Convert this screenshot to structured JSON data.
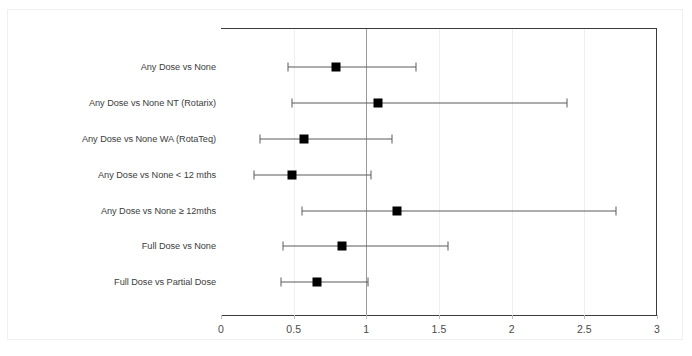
{
  "chart_data": {
    "type": "scatter",
    "subtype": "forest-plot",
    "title": "",
    "xlabel": "",
    "ylabel": "",
    "xlim": [
      0,
      3
    ],
    "xticks": [
      "0",
      "0.5",
      "1",
      "1.5",
      "2",
      "2.5",
      "3"
    ],
    "xtick_values": [
      0,
      0.5,
      1,
      1.5,
      2,
      2.5,
      3
    ],
    "grid": true,
    "legend": "none",
    "reference_line": 1,
    "categories": [
      "Any Dose vs None",
      "Any Dose vs None NT (Rotarix)",
      "Any Dose vs None WA (RotaTeq)",
      "Any Dose vs None < 12 mths",
      "Any Dose vs None ≥ 12mths",
      "Full Dose vs None",
      "Full Dose vs Partial Dose"
    ],
    "values": [
      0.79,
      1.08,
      0.57,
      0.49,
      1.21,
      0.83,
      0.66
    ],
    "ci_lower": [
      0.46,
      0.49,
      0.27,
      0.23,
      0.56,
      0.43,
      0.41
    ],
    "ci_upper": [
      1.34,
      2.38,
      1.18,
      1.03,
      2.72,
      1.56,
      1.01
    ],
    "rows": [
      {
        "label": "Any Dose vs None",
        "estimate": 0.79,
        "low": 0.46,
        "high": 1.34
      },
      {
        "label": "Any Dose vs None NT (Rotarix)",
        "estimate": 1.08,
        "low": 0.49,
        "high": 2.38
      },
      {
        "label": "Any Dose vs None WA (RotaTeq)",
        "estimate": 0.57,
        "low": 0.27,
        "high": 1.18
      },
      {
        "label": "Any Dose vs None < 12 mths",
        "estimate": 0.49,
        "low": 0.23,
        "high": 1.03
      },
      {
        "label": "Any Dose vs None ≥ 12mths",
        "estimate": 1.21,
        "low": 0.56,
        "high": 2.72
      },
      {
        "label": "Full Dose vs None",
        "estimate": 0.83,
        "low": 0.43,
        "high": 1.56
      },
      {
        "label": "Full Dose vs Partial Dose",
        "estimate": 0.66,
        "low": 0.41,
        "high": 1.01
      }
    ],
    "colors": {
      "marker": "#000000",
      "ci": "#5a5a5a",
      "axis": "#3a3a3a",
      "grid": "#efefef",
      "reference": "#9a9a9a",
      "background": "#ffffff",
      "text": "#3c3c3c"
    }
  }
}
